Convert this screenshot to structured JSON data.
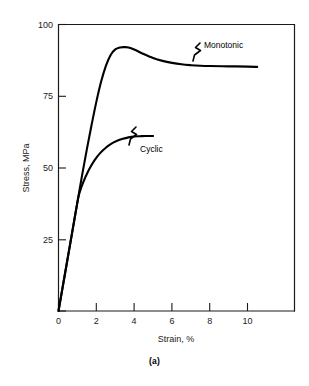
{
  "figure": {
    "caption": "(a)",
    "background": "#ffffff",
    "ink_color": "#000000"
  },
  "chart_data": {
    "type": "line",
    "title": "",
    "xlabel": "Strain, %",
    "ylabel": "Stress, MPa",
    "xlim": [
      0,
      12.5
    ],
    "ylim": [
      0,
      100
    ],
    "xticks": [
      0,
      2,
      4,
      6,
      8,
      10
    ],
    "xtick_labels": [
      "0",
      "2",
      "4",
      "6",
      "8",
      "10"
    ],
    "yticks": [
      0,
      25,
      50,
      75,
      100
    ],
    "ytick_labels": [
      "0",
      "25",
      "50",
      "75",
      "100"
    ],
    "grid": false,
    "legend": "inline-annotations",
    "series": [
      {
        "name": "Monotonic",
        "label": "Monotonic",
        "annotation": "Monotonic",
        "x": [
          0,
          0.25,
          0.5,
          0.75,
          1.0,
          1.25,
          1.5,
          1.75,
          2.0,
          2.25,
          2.5,
          2.75,
          3.0,
          3.25,
          3.5,
          3.7,
          4.0,
          4.5,
          5.0,
          5.5,
          6.0,
          6.5,
          7.0,
          7.5,
          8.0,
          9.0,
          10.0,
          10.5
        ],
        "y": [
          0,
          9.5,
          19.0,
          28.5,
          38.0,
          47.5,
          56.5,
          65.0,
          73.0,
          80.0,
          85.5,
          89.3,
          91.3,
          92.0,
          92.1,
          92.0,
          91.3,
          89.7,
          88.3,
          87.3,
          86.6,
          86.1,
          85.8,
          85.6,
          85.5,
          85.4,
          85.3,
          85.2
        ]
      },
      {
        "name": "Cyclic",
        "label": "Cyclic",
        "annotation": "Cyclic",
        "x": [
          0,
          0.25,
          0.5,
          0.75,
          1.0,
          1.1,
          1.3,
          1.6,
          1.9,
          2.2,
          2.5,
          2.8,
          3.1,
          3.4,
          3.7,
          4.0,
          4.3,
          4.6,
          5.0
        ],
        "y": [
          0,
          9.5,
          19.0,
          28.5,
          38.0,
          41.0,
          44.8,
          49.2,
          52.6,
          55.1,
          57.0,
          58.4,
          59.4,
          60.1,
          60.6,
          60.9,
          61.0,
          61.1,
          61.1
        ]
      }
    ],
    "annotations": [
      {
        "text": "Monotonic",
        "x": 11.0,
        "y": 90.5,
        "leader": "zigzag"
      },
      {
        "text": "Cyclic",
        "x": 5.0,
        "y": 55.5,
        "leader": "zigzag"
      }
    ]
  }
}
